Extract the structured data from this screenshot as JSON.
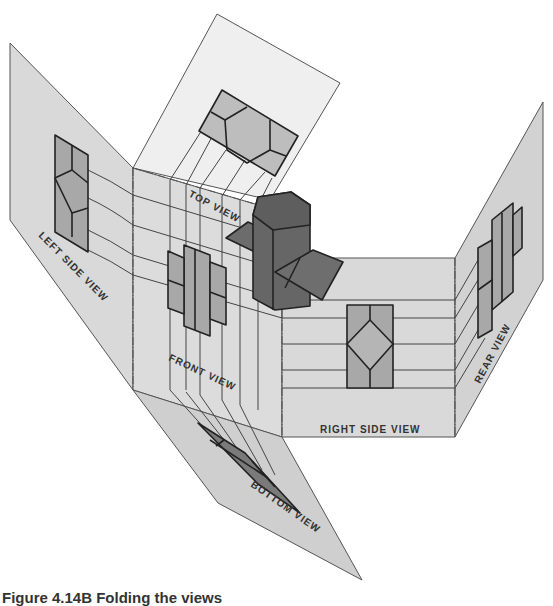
{
  "figure": {
    "caption": "Figure 4.14B  Folding the views",
    "colors": {
      "plane_light": "#ececec",
      "plane_mid": "#d6d6d6",
      "view_fill": "#a8a8a8",
      "view_fill_light": "#bdbdbd",
      "object_dark": "#6a6a6a",
      "object_mid": "#7e7e7e",
      "line": "#222222"
    },
    "labels": {
      "top_view": "TOP VIEW",
      "left_side_view": "LEFT SIDE VIEW",
      "front_view": "FRONT VIEW",
      "right_side_view": "RIGHT SIDE VIEW",
      "rear_view": "REAR VIEW",
      "bottom_view": "BOTTOM VIEW"
    }
  }
}
